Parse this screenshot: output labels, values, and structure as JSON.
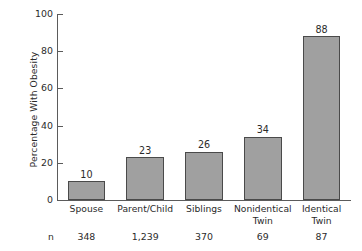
{
  "chart_data": {
    "type": "bar",
    "title": "",
    "xlabel": "",
    "ylabel": "Percentage With Obesity",
    "ylim": [
      0,
      100
    ],
    "yticks": [
      0,
      20,
      40,
      60,
      80,
      100
    ],
    "ytick_labels": [
      "0",
      "20",
      "40",
      "60",
      "80",
      "100"
    ],
    "grid": false,
    "legend": false,
    "categories": [
      "Spouse",
      "Parent/Child",
      "Siblings",
      "Nonidentical Twin",
      "Identical Twin"
    ],
    "category_lines": [
      [
        "Spouse"
      ],
      [
        "Parent/Child"
      ],
      [
        "Siblings"
      ],
      [
        "Nonidentical",
        "Twin"
      ],
      [
        "Identical",
        "Twin"
      ]
    ],
    "values": [
      10,
      23,
      26,
      34,
      88
    ],
    "value_labels": [
      "10",
      "23",
      "26",
      "34",
      "88"
    ],
    "bar_color": "#a0a0a0",
    "bar_edge_color": "#4a4a4a",
    "axis_color": "#5b5b5b",
    "background": "#ffffff",
    "annotations": {
      "n_key": "n",
      "n_labels": [
        "348",
        "1,239",
        "370",
        "69",
        "87"
      ]
    }
  }
}
